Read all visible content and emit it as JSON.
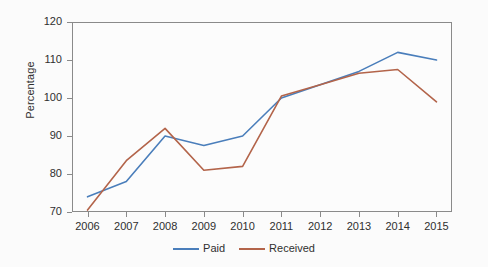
{
  "chart_data": {
    "type": "line",
    "title": "",
    "xlabel": "",
    "ylabel": "Percentage",
    "categories": [
      "2006",
      "2007",
      "2008",
      "2009",
      "2010",
      "2011",
      "2012",
      "2013",
      "2014",
      "2015"
    ],
    "x": [
      2006,
      2007,
      2008,
      2009,
      2010,
      2011,
      2012,
      2013,
      2014,
      2015
    ],
    "xlim": [
      2005.6,
      2015.4
    ],
    "ylim": [
      70,
      120
    ],
    "yticks": [
      70,
      80,
      90,
      100,
      110,
      120
    ],
    "ytick_labels": [
      "70",
      "80",
      "90",
      "100",
      "110",
      "120"
    ],
    "xticks": [
      2006,
      2007,
      2008,
      2009,
      2010,
      2011,
      2012,
      2013,
      2014,
      2015
    ],
    "xtick_labels": [
      "2006",
      "2007",
      "2008",
      "2009",
      "2010",
      "2011",
      "2012",
      "2013",
      "2014",
      "2015"
    ],
    "grid": false,
    "legend_position": "bottom-center",
    "series": [
      {
        "name": "Paid",
        "color": "#4A7EBB",
        "values": [
          74.0,
          78.0,
          90.0,
          87.5,
          90.0,
          100.0,
          103.5,
          107.0,
          112.0,
          110.0
        ]
      },
      {
        "name": "Received",
        "color": "#B3644A",
        "values": [
          70.5,
          83.5,
          92.0,
          81.0,
          82.0,
          100.5,
          103.5,
          106.5,
          107.5,
          99.0
        ]
      }
    ]
  },
  "legend": {
    "items": [
      {
        "label": "Paid",
        "color": "#4A7EBB"
      },
      {
        "label": "Received",
        "color": "#B3644A"
      }
    ]
  },
  "axes": {
    "y_title": "Percentage"
  }
}
